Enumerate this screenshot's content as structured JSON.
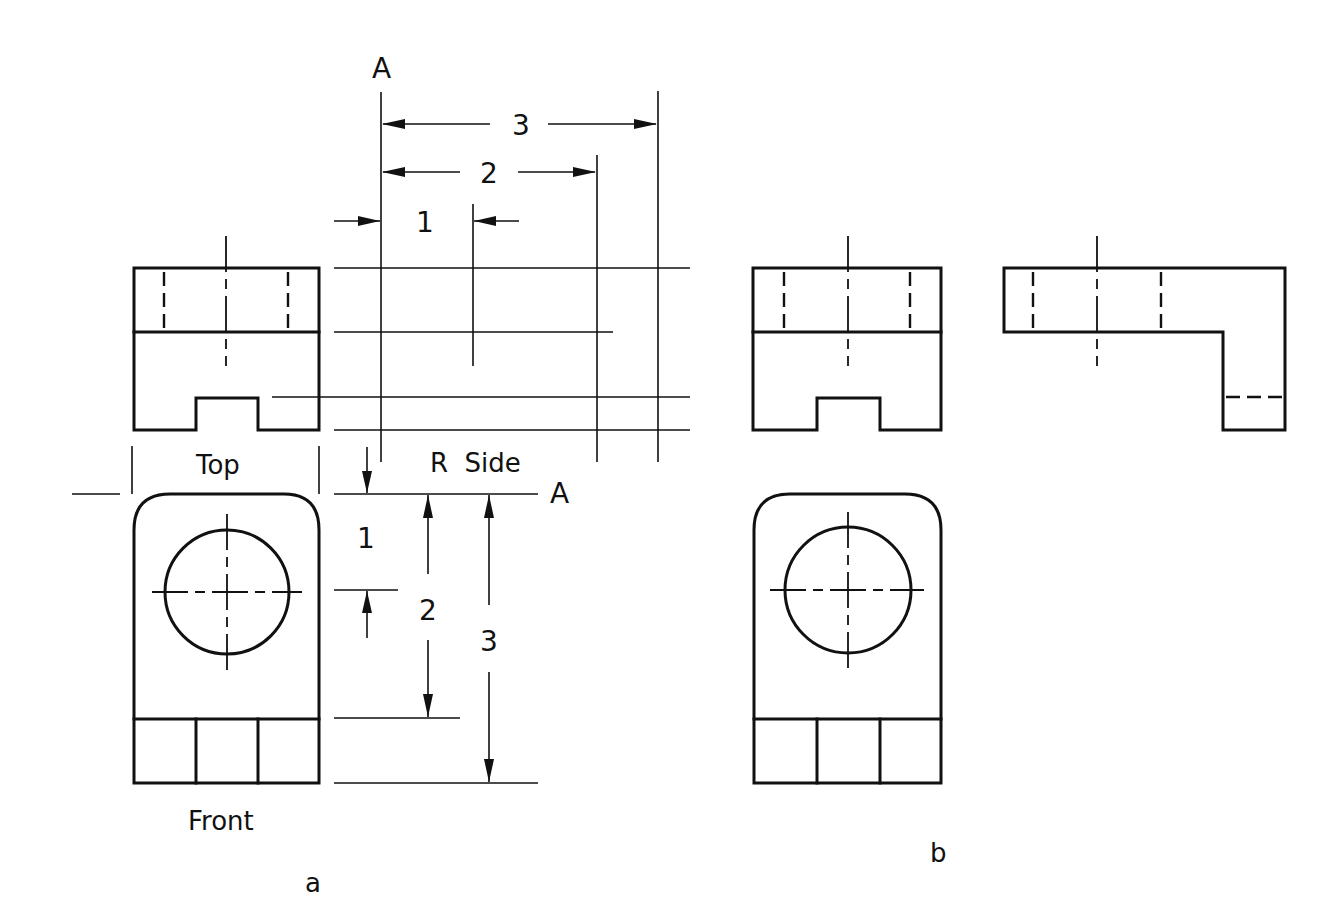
{
  "figure": {
    "part_a_label": "a",
    "part_b_label": "b"
  },
  "views": {
    "top": "Top",
    "front": "Front",
    "right_side": "R  Side"
  },
  "reference_plane": {
    "label_top": "A",
    "label_right": "A"
  },
  "horizontal_dimensions": [
    {
      "label": "1"
    },
    {
      "label": "2"
    },
    {
      "label": "3"
    }
  ],
  "vertical_dimensions": [
    {
      "label": "1"
    },
    {
      "label": "2"
    },
    {
      "label": "3"
    }
  ]
}
